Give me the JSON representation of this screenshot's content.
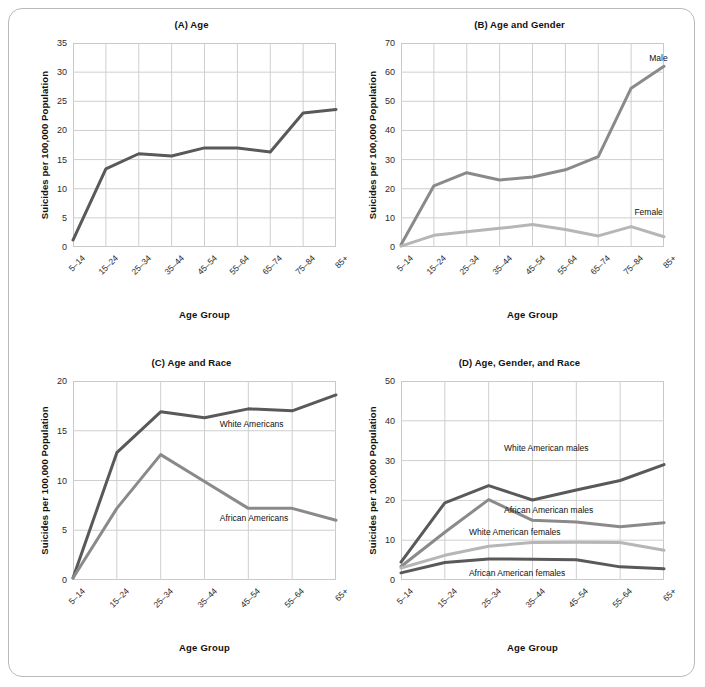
{
  "figure": {
    "ylabel": "Suicides per 100,000 Population",
    "xlabel": "Age Group"
  },
  "colors": {
    "dark": "#595959",
    "mid": "#8a8a8a",
    "light": "#b6b6b6",
    "grid": "#cfcfcf",
    "frame": "#c9c9c9",
    "border": "#b9b9b9"
  },
  "chart_data": [
    {
      "id": "A",
      "type": "line",
      "title": "(A) Age",
      "xlabel": "Age Group",
      "ylabel": "Suicides per 100,000 Population",
      "categories": [
        "5–14",
        "15–24",
        "25–34",
        "35–44",
        "45–54",
        "55–64",
        "65–74",
        "75–84",
        "85+"
      ],
      "yticks": [
        0,
        5,
        10,
        15,
        20,
        25,
        30,
        35
      ],
      "ylim": [
        0,
        35
      ],
      "grid": true,
      "legend": "none",
      "series": [
        {
          "name": "All",
          "color": "#595959",
          "values": [
            1.2,
            13.4,
            16.0,
            15.6,
            17.0,
            17.0,
            16.3,
            23.0,
            23.6
          ]
        }
      ]
    },
    {
      "id": "B",
      "type": "line",
      "title": "(B) Age and Gender",
      "xlabel": "Age Group",
      "ylabel": "Suicides per 100,000 Population",
      "categories": [
        "5–14",
        "15–24",
        "25–34",
        "35–44",
        "45–54",
        "55–64",
        "65–74",
        "75–84",
        "85+"
      ],
      "yticks": [
        0,
        10,
        20,
        30,
        40,
        50,
        60,
        70
      ],
      "ylim": [
        0,
        70
      ],
      "grid": true,
      "legend": "inline-labels",
      "series": [
        {
          "name": "Male",
          "color": "#8a8a8a",
          "label_x": 7.55,
          "label_y": 64.5,
          "values": [
            0.8,
            21.0,
            25.5,
            23.0,
            24.0,
            26.5,
            31.0,
            54.5,
            62.0
          ]
        },
        {
          "name": "Female",
          "color": "#b6b6b6",
          "label_x": 7.1,
          "label_y": 11.5,
          "values": [
            0.3,
            4.0,
            5.2,
            6.4,
            7.7,
            6.0,
            3.8,
            7.0,
            3.5
          ]
        }
      ]
    },
    {
      "id": "C",
      "type": "line",
      "title": "(C) Age and Race",
      "xlabel": "Age Group",
      "ylabel": "Suicides per 100,000 Population",
      "categories": [
        "5–14",
        "15–24",
        "25–34",
        "35–44",
        "45–54",
        "55–64",
        "65+"
      ],
      "yticks": [
        0,
        5,
        10,
        15,
        20
      ],
      "ylim": [
        0,
        20
      ],
      "grid": true,
      "legend": "inline-labels",
      "series": [
        {
          "name": "White Americans",
          "color": "#595959",
          "label_x": 3.35,
          "label_y": 15.6,
          "values": [
            0.2,
            12.8,
            16.9,
            16.3,
            17.2,
            17.0,
            18.6
          ]
        },
        {
          "name": "African Americans",
          "color": "#8a8a8a",
          "label_x": 3.35,
          "label_y": 6.1,
          "values": [
            0.2,
            7.2,
            12.6,
            9.9,
            7.2,
            7.2,
            6.0
          ]
        }
      ]
    },
    {
      "id": "D",
      "type": "line",
      "title": "(D) Age, Gender, and Race",
      "xlabel": "Age Group",
      "ylabel": "Suicides per 100,000 Population",
      "categories": [
        "5–14",
        "15–24",
        "25–34",
        "35–44",
        "45–54",
        "55–64",
        "65+"
      ],
      "yticks": [
        0,
        10,
        20,
        30,
        40,
        50
      ],
      "ylim": [
        0,
        50
      ],
      "grid": true,
      "legend": "inline-labels",
      "series": [
        {
          "name": "White American males",
          "color": "#595959",
          "label_x": 2.35,
          "label_y": 33.0,
          "values": [
            4.5,
            19.4,
            23.7,
            20.1,
            22.6,
            25.0,
            29.0
          ]
        },
        {
          "name": "African American males",
          "color": "#8a8a8a",
          "label_x": 2.35,
          "label_y": 17.3,
          "values": [
            3.4,
            12.0,
            20.2,
            15.0,
            14.6,
            13.4,
            14.4
          ]
        },
        {
          "name": "White American females",
          "color": "#b6b6b6",
          "label_x": 1.55,
          "label_y": 11.9,
          "values": [
            3.0,
            6.2,
            8.5,
            9.4,
            9.5,
            9.4,
            7.5
          ]
        },
        {
          "name": "African American females",
          "color": "#595959",
          "label_x": 1.55,
          "label_y": 1.4,
          "values": [
            1.8,
            4.4,
            5.3,
            5.2,
            5.1,
            3.3,
            2.8
          ]
        }
      ]
    }
  ]
}
